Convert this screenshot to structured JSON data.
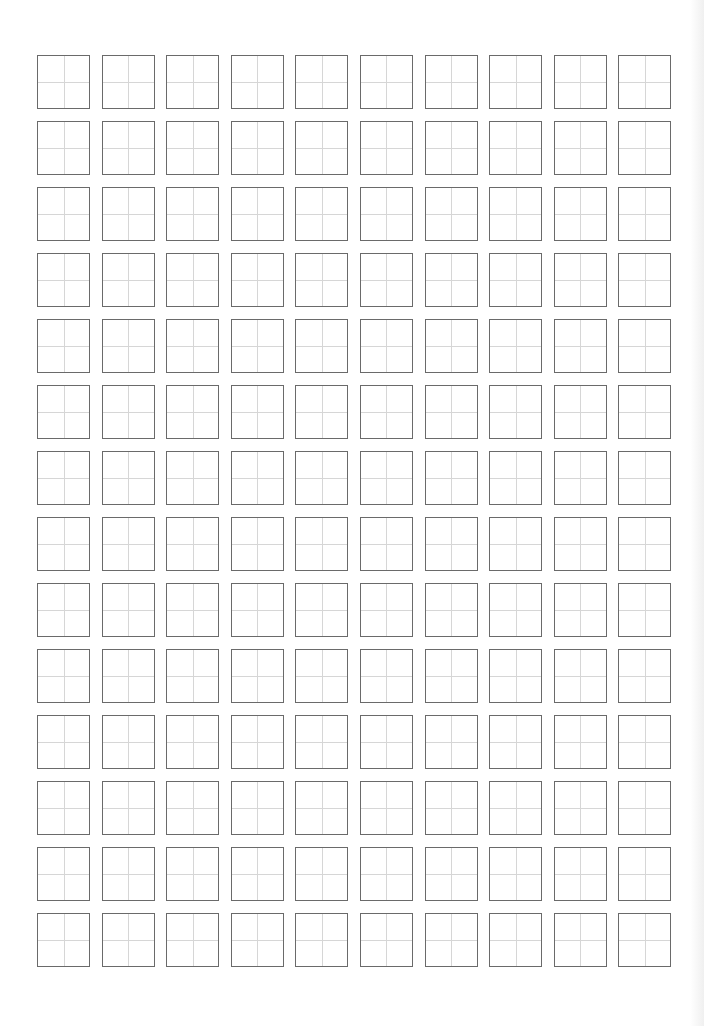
{
  "page": {
    "type": "practice-grid-sheet",
    "rows": 14,
    "columns": 10,
    "cell_style": "four-quadrant guide (tian zi ge)",
    "colors": {
      "background": "#ffffff",
      "cell_border": "#6a6a6a",
      "guide_lines": "#d6d6d6"
    }
  }
}
